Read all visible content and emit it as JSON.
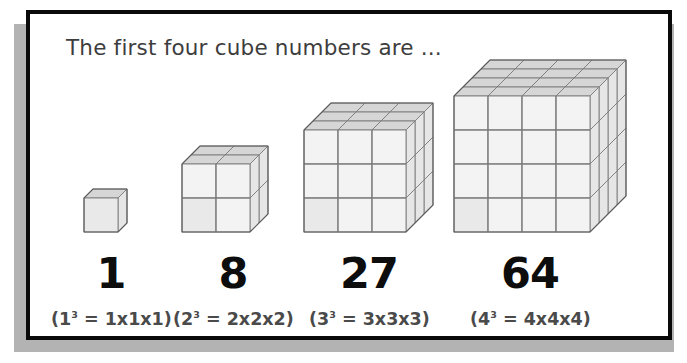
{
  "slide": {
    "title": "The first four cube numbers are ...",
    "frame_color": "#0a0a0a",
    "shadow_color": "#b3b3b3",
    "background_color": "#ffffff",
    "title_color": "#3d3d3d"
  },
  "cube_style": {
    "front_fill": "#f3f3f3",
    "top_fill": "#d6d6d6",
    "side_fill": "#e6e6e6",
    "edge_stroke": "#7a7a7a",
    "outline_stroke": "#5a5a5a",
    "cell_px": 34,
    "dx": 9,
    "dy": -9
  },
  "columns": [
    {
      "index": 1,
      "n": 1,
      "value": "1",
      "formula_base": "(1",
      "formula_exp": "3",
      "formula_rest": " = 1x1x1)",
      "formula_full": "(1³ = 1x1x1)",
      "center_x": 81,
      "number_label": "1"
    },
    {
      "index": 2,
      "n": 2,
      "value": "8",
      "formula_base": "(2",
      "formula_exp": "3",
      "formula_rest": " = 2x2x2)",
      "formula_full": "(2³ = 2x2x2)",
      "center_x": 203,
      "number_label": "8"
    },
    {
      "index": 3,
      "n": 3,
      "value": "27",
      "formula_base": "(3",
      "formula_exp": "3",
      "formula_rest": " = 3x3x3)",
      "formula_full": "(3³ = 3x3x3)",
      "center_x": 339,
      "number_label": "27"
    },
    {
      "index": 4,
      "n": 4,
      "value": "64",
      "formula_base": "(4",
      "formula_exp": "3",
      "formula_rest": " = 4x4x4)",
      "formula_full": "(4³ = 4x4x4)",
      "center_x": 500,
      "number_label": "64"
    }
  ],
  "cube_layout": [
    {
      "n": 1,
      "left": 54,
      "baseline_y": 218
    },
    {
      "n": 2,
      "left": 152,
      "baseline_y": 218
    },
    {
      "n": 3,
      "left": 274,
      "baseline_y": 218
    },
    {
      "n": 4,
      "left": 424,
      "baseline_y": 218
    }
  ]
}
